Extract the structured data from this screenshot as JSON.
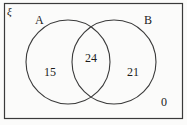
{
  "diagram": {
    "type": "venn",
    "universe_symbol": "ξ",
    "sets": [
      {
        "id": "A",
        "label": "A"
      },
      {
        "id": "B",
        "label": "B"
      }
    ],
    "regions": [
      {
        "id": "a-only",
        "label": "A only",
        "value": "15"
      },
      {
        "id": "both",
        "label": "A and B",
        "value": "24"
      },
      {
        "id": "b-only",
        "label": "B only",
        "value": "21"
      },
      {
        "id": "outside",
        "label": "Outside A and B",
        "value": "0"
      }
    ],
    "colors": {
      "stroke": "#3a3a3a",
      "background": "#fbfbfa",
      "text": "#1b1b1b"
    }
  }
}
